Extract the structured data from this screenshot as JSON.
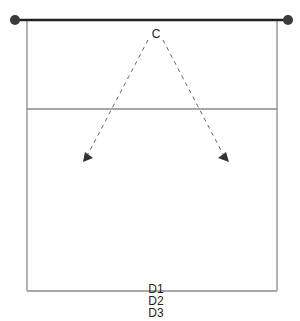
{
  "diagram": {
    "type": "court-drill",
    "labels": {
      "top_player": "C",
      "bottom_players": [
        "D1",
        "D2",
        "D3"
      ]
    },
    "colors": {
      "line": "#222222",
      "court_line": "#888888",
      "dot": "#3a3a3a",
      "arrow": "#555555"
    }
  }
}
